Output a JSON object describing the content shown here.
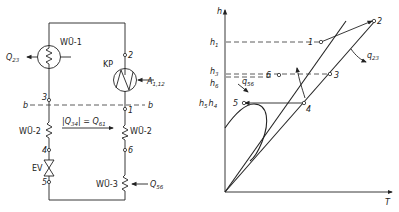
{
  "schematic": {
    "components": {
      "heat_exchanger_1": "WÜ-1",
      "compressor": "KP",
      "heat_exchanger_2_left": "WÜ-2",
      "heat_exchanger_2_right": "WÜ-2",
      "heat_exchanger_3": "WÜ-3",
      "expansion_valve": "EV"
    },
    "nodes": [
      "1",
      "2",
      "3",
      "4",
      "5",
      "6"
    ],
    "section_line": {
      "left": "b",
      "right": "b"
    },
    "heat_flows": {
      "q23": {
        "symbol": "Q",
        "sub": "23"
      },
      "a112": {
        "symbol": "A",
        "sub": "1,12"
      },
      "q56": {
        "symbol": "Q",
        "sub": "56"
      },
      "internal": {
        "lhs": "|Q",
        "lhs_sub": "34",
        "mid": "| = Q",
        "rhs_sub": "61"
      }
    }
  },
  "ts_chart": {
    "axes": {
      "y": "h",
      "x": "T"
    },
    "y_labels": [
      {
        "symbol": "h",
        "sub": "1"
      },
      {
        "symbol": "h",
        "sub": "3"
      },
      {
        "symbol": "h",
        "sub": "6"
      },
      {
        "symbol": "h",
        "sub": "5",
        "symbol2": "h",
        "sub2": "4"
      }
    ],
    "points": [
      "1",
      "2",
      "3",
      "4",
      "5",
      "6"
    ],
    "annotations": {
      "q23": {
        "symbol": "q",
        "sub": "23"
      },
      "q56": {
        "symbol": "q",
        "sub": "56"
      }
    }
  }
}
